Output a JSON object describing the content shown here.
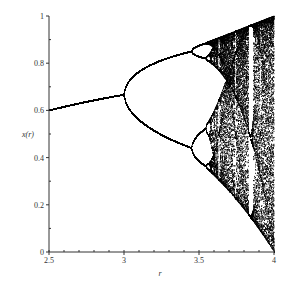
{
  "chart_data": {
    "type": "scatter",
    "title": "",
    "subtitle": "Bifurcation diagram of the logistic map x -> r x (1 - x)",
    "xlabel": "r",
    "ylabel": "x(r)",
    "xlim": [
      2.5,
      4
    ],
    "ylim": [
      0,
      1
    ],
    "x_ticks": [
      2.5,
      3,
      3.5,
      4
    ],
    "x_tick_labels": [
      "2.5",
      "3",
      "3.5",
      "4"
    ],
    "y_ticks": [
      0,
      0.2,
      0.4,
      0.6,
      0.8,
      1
    ],
    "y_tick_labels": [
      "0",
      "0.2",
      "0.4",
      "0.6",
      "0.8",
      "1"
    ],
    "grid": false,
    "legend": null,
    "series": [
      {
        "name": "logistic map attractor",
        "description": "Single fixed point from r=2.5 (x=0.6) to r=3 (x≈0.667); period-2 branches from r=3 to ≈3.45 (≈0.85 and ≈0.44); period-4 to ≈3.54; chaos from ≈3.57 to 4 filling 0..1 with periodic windows (notably near r≈3.83).",
        "key_points": [
          {
            "r": 2.5,
            "x": [
              0.6
            ]
          },
          {
            "r": 3.0,
            "x": [
              0.667
            ]
          },
          {
            "r": 3.2,
            "x": [
              0.513,
              0.799
            ]
          },
          {
            "r": 3.45,
            "x": [
              0.44,
              0.85
            ]
          },
          {
            "r": 3.5,
            "x": [
              0.383,
              0.501,
              0.827,
              0.875
            ]
          },
          {
            "r": 4.0,
            "x": [
              0,
              1
            ]
          }
        ],
        "color": "#000000"
      }
    ]
  },
  "plot": {
    "x_axis_label": "r",
    "y_axis_label": "x(r)"
  }
}
